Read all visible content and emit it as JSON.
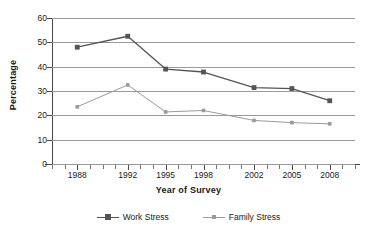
{
  "chart_data": {
    "type": "line",
    "title": "",
    "xlabel": "Year of Survey",
    "ylabel": "Percentage",
    "x": [
      1988,
      1992,
      1995,
      1998,
      2002,
      2005,
      2008
    ],
    "categories": [
      "1988",
      "1992",
      "1995",
      "1998",
      "2002",
      "2005",
      "2008"
    ],
    "xlim": [
      1986,
      2010
    ],
    "ylim": [
      0,
      60
    ],
    "yticks": [
      0,
      10,
      20,
      30,
      40,
      50,
      60
    ],
    "ytick_labels": [
      "0",
      "10",
      "20",
      "30",
      "40",
      "50",
      "60"
    ],
    "grid": "horizontal",
    "legend_position": "bottom",
    "series": [
      {
        "name": "Work Stress",
        "values": [
          48,
          52.5,
          39,
          37.8,
          31.4,
          31,
          26
        ],
        "color": "#555555",
        "marker": "square"
      },
      {
        "name": "Family Stress",
        "values": [
          23.5,
          32.5,
          21.4,
          22,
          17.9,
          17,
          16.5
        ],
        "color": "#9a9a9a",
        "marker": "square-small"
      }
    ]
  },
  "axes": {
    "y_title": "Percentage",
    "x_title": "Year of Survey"
  },
  "legend": {
    "entries": [
      {
        "label": "Work Stress"
      },
      {
        "label": "Family Stress"
      }
    ]
  },
  "colors": {
    "work_stress": "#555555",
    "family_stress": "#9a9a9a",
    "gridline": "#9a9a9a",
    "axis": "#4a4a4a",
    "text": "#1a1a1a",
    "background": "#ffffff"
  }
}
